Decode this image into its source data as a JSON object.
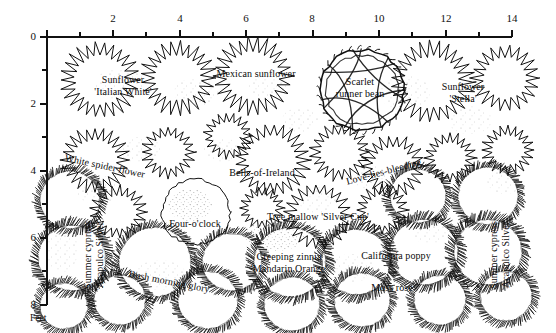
{
  "figure": {
    "kind": "garden-planting-plan",
    "unit_label": "Feet",
    "background": "#ffffff",
    "ink": "#111111"
  },
  "axes": {
    "top": {
      "label": "",
      "ticks": [
        "0",
        "2",
        "4",
        "6",
        "8",
        "10",
        "12",
        "14"
      ],
      "values": [
        0,
        2,
        4,
        6,
        8,
        10,
        12,
        14
      ],
      "range": [
        0,
        14
      ]
    },
    "left": {
      "label": "Feet",
      "ticks": [
        "0",
        "2",
        "4",
        "6",
        "8"
      ],
      "values": [
        0,
        2,
        4,
        6,
        8
      ],
      "range": [
        0,
        8
      ]
    }
  },
  "chart_data": {
    "type": "diagram",
    "title": "",
    "xlabel": "Feet",
    "ylabel": "Feet",
    "xlim": [
      0,
      14
    ],
    "ylim": [
      0,
      8
    ],
    "grid": false,
    "legend": "none",
    "plants": [
      {
        "name": "Sunflower 'Italian White'",
        "lines": [
          "Sunflower",
          "'Italian White'"
        ],
        "x": 2.0,
        "y": 1.2,
        "style": "spiky"
      },
      {
        "name": "Mexican sunflower",
        "lines": [
          "Mexican sunflower"
        ],
        "x": 5.5,
        "y": 0.9,
        "style": "spiky"
      },
      {
        "name": "Scarlet runner bean",
        "lines": [
          "Scarlet",
          "runner bean"
        ],
        "x": 8.6,
        "y": 1.3,
        "style": "teepee"
      },
      {
        "name": "Sunflower 'Stella'",
        "lines": [
          "Sunflower",
          "'Stella'"
        ],
        "x": 12.1,
        "y": 1.3,
        "style": "spiky"
      },
      {
        "name": "White spider flower",
        "lines": [
          "White spider flower"
        ],
        "x": 1.9,
        "y": 3.1,
        "style": "spiky-curved"
      },
      {
        "name": "Bells-of-Ireland",
        "lines": [
          "Bells-of-Ireland"
        ],
        "x": 5.6,
        "y": 3.4,
        "style": "spiky"
      },
      {
        "name": "Love-lies-bleeding",
        "lines": [
          "Love-lies-bleeding"
        ],
        "x": 9.6,
        "y": 3.2,
        "style": "spiky-curved"
      },
      {
        "name": "Four-o'clock",
        "lines": [
          "Four-o'clock"
        ],
        "x": 3.9,
        "y": 5.0,
        "style": "round"
      },
      {
        "name": "Tree mallow 'Silver Cup'",
        "lines": [
          "Tree mallow 'Silver Cup'"
        ],
        "x": 7.6,
        "y": 5.1,
        "style": "spiky"
      },
      {
        "name": "Summer cypress 'Acapulco Silver' (left)",
        "lines": [
          "Summer cypress",
          "'Acapulco Silver'"
        ],
        "x": 1.0,
        "y": 6.2,
        "style": "feathery",
        "orientation": "vertical"
      },
      {
        "name": "Bush morning glory",
        "lines": [
          "Bush morning glory"
        ],
        "x": 3.6,
        "y": 6.9,
        "style": "round-curved"
      },
      {
        "name": "Creeping zinnia 'Mandarin Orange'",
        "lines": [
          "Creeping zinnia",
          "'Mandarin Orange'"
        ],
        "x": 7.0,
        "y": 6.6,
        "style": "feathery"
      },
      {
        "name": "California poppy",
        "lines": [
          "California poppy"
        ],
        "x": 10.6,
        "y": 6.2,
        "style": "feathery"
      },
      {
        "name": "Moss rose",
        "lines": [
          "Moss rose"
        ],
        "x": 10.3,
        "y": 7.5,
        "style": "feathery"
      },
      {
        "name": "Summer cypress 'Acapulco Silver' (right)",
        "lines": [
          "Summer cypress",
          "'Acapulco Silver'"
        ],
        "x": 13.1,
        "y": 6.3,
        "style": "feathery",
        "orientation": "vertical"
      }
    ]
  },
  "labels": {
    "sunflower_italian_white_1": "Sunflower",
    "sunflower_italian_white_2": "'Italian White'",
    "mexican_sunflower": "Mexican sunflower",
    "scarlet_runner_bean_1": "Scarlet",
    "scarlet_runner_bean_2": "runner bean",
    "sunflower_stella_1": "Sunflower",
    "sunflower_stella_2": "'Stella'",
    "white_spider_flower": "White spider flower",
    "bells_of_ireland": "Bells-of-Ireland",
    "love_lies_bleeding": "Love-lies-bleeding",
    "four_oclock": "Four-o'clock",
    "tree_mallow": "Tree mallow 'Silver Cup'",
    "summer_cypress_left_1": "Summer cypress",
    "summer_cypress_left_2": "'Acapulco Silver'",
    "bush_morning_glory": "Bush morning glory",
    "creeping_zinnia_1": "Creeping zinnia",
    "creeping_zinnia_2": "'Mandarin Orange'",
    "california_poppy": "California poppy",
    "moss_rose": "Moss rose",
    "summer_cypress_right_1": "Summer cypress",
    "summer_cypress_right_2": "'Acapulco Silver'"
  },
  "axis_text": {
    "x0": "0",
    "x2": "2",
    "x4": "4",
    "x6": "6",
    "x8": "8",
    "x10": "10",
    "x12": "12",
    "x14": "14",
    "y0": "0",
    "y2": "2",
    "y4": "4",
    "y6": "6",
    "y8": "8",
    "unit": "Feet"
  }
}
